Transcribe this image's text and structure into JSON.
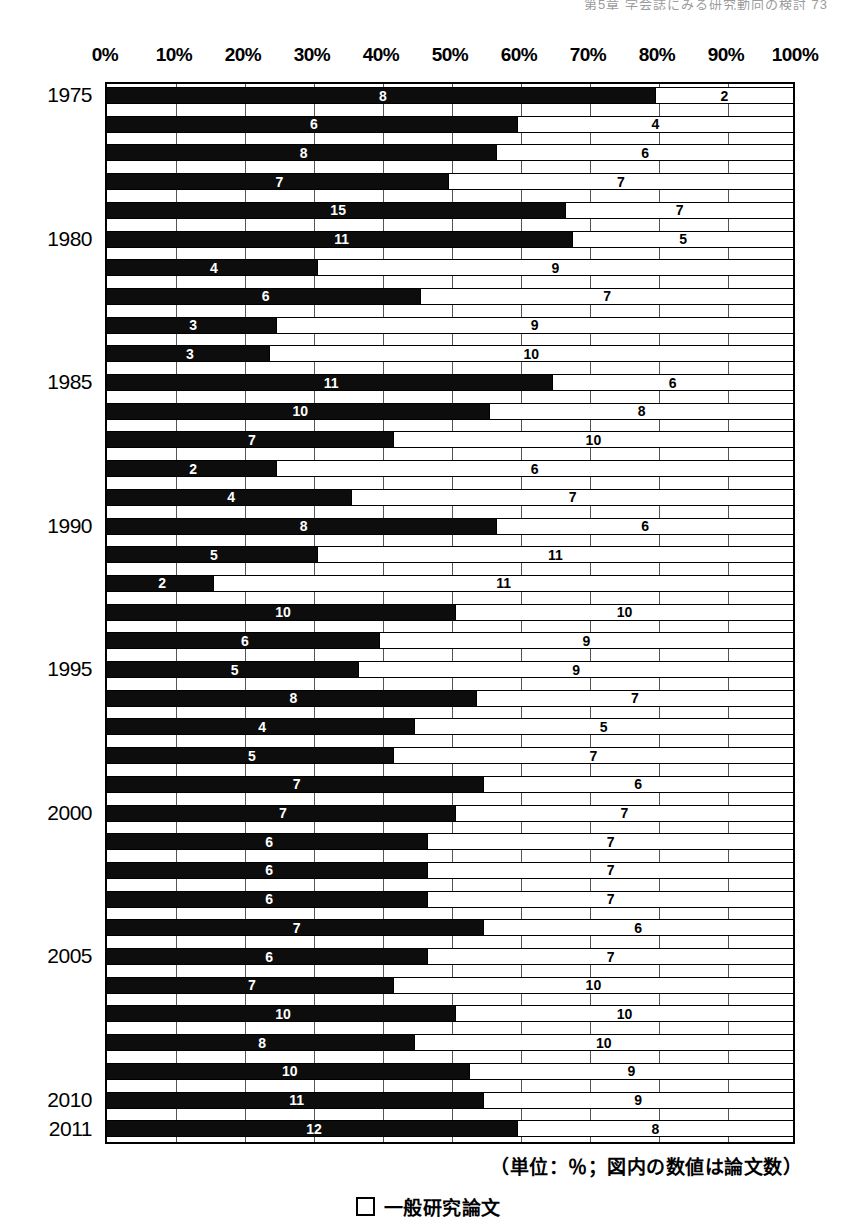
{
  "header": {
    "running_text": "第5章 学会誌にみる研究動向の検討 73"
  },
  "footer": {
    "unit_note": "（単位：％；図内の数値は論文数）"
  },
  "legend": {
    "items": [
      {
        "swatch": "white-square-icon",
        "label": "一般研究論文"
      }
    ]
  },
  "chart_data": {
    "type": "bar",
    "orientation": "horizontal",
    "stacked": true,
    "normalized": "100%",
    "title": "",
    "xlabel": "",
    "ylabel": "",
    "xlim": [
      0,
      100
    ],
    "xticks": [
      "0%",
      "10%",
      "20%",
      "30%",
      "40%",
      "50%",
      "60%",
      "70%",
      "80%",
      "90%",
      "100%"
    ],
    "xtick_values": [
      0,
      10,
      20,
      30,
      40,
      50,
      60,
      70,
      80,
      90,
      100
    ],
    "grid": true,
    "legend_position": "bottom-center",
    "value_labels_are": "論文数 (paper counts)",
    "categories": [
      "1975",
      "1976",
      "1977",
      "1978",
      "1979",
      "1980",
      "1981",
      "1982",
      "1983",
      "1984",
      "1985",
      "1986",
      "1987",
      "1988",
      "1989",
      "1990",
      "1991",
      "1992",
      "1993",
      "1994",
      "1995",
      "1996",
      "1997",
      "1998",
      "1999",
      "2000",
      "2001",
      "2002",
      "2003",
      "2004",
      "2005",
      "2006",
      "2007",
      "2008",
      "2009",
      "2010",
      "2011"
    ],
    "visible_category_labels": [
      "1975",
      "1980",
      "1985",
      "1990",
      "1995",
      "2000",
      "2005",
      "2010",
      "2011"
    ],
    "series": [
      {
        "name": "",
        "color": "#0d0d0d",
        "percents": [
          80,
          60,
          57,
          50,
          67,
          68,
          31,
          46,
          25,
          24,
          65,
          56,
          42,
          25,
          36,
          57,
          31,
          16,
          51,
          40,
          37,
          54,
          45,
          42,
          55,
          51,
          47,
          47,
          47,
          55,
          47,
          42,
          51,
          45,
          53,
          55,
          60
        ],
        "counts": [
          8,
          6,
          8,
          7,
          15,
          11,
          4,
          6,
          3,
          3,
          11,
          10,
          7,
          2,
          4,
          8,
          5,
          2,
          10,
          6,
          5,
          8,
          4,
          5,
          7,
          7,
          6,
          6,
          6,
          7,
          6,
          7,
          10,
          8,
          10,
          11,
          12
        ]
      },
      {
        "name": "一般研究論文",
        "color": "#ffffff",
        "percents": [
          20,
          40,
          43,
          50,
          33,
          32,
          69,
          54,
          75,
          76,
          35,
          44,
          58,
          75,
          64,
          43,
          69,
          84,
          49,
          60,
          63,
          46,
          55,
          58,
          45,
          49,
          53,
          53,
          53,
          45,
          53,
          58,
          49,
          55,
          47,
          45,
          40
        ],
        "counts": [
          2,
          4,
          6,
          7,
          7,
          5,
          9,
          7,
          9,
          10,
          6,
          8,
          10,
          6,
          7,
          6,
          11,
          11,
          10,
          9,
          9,
          7,
          5,
          7,
          6,
          7,
          7,
          7,
          7,
          6,
          7,
          10,
          10,
          10,
          9,
          9,
          8
        ]
      }
    ]
  }
}
